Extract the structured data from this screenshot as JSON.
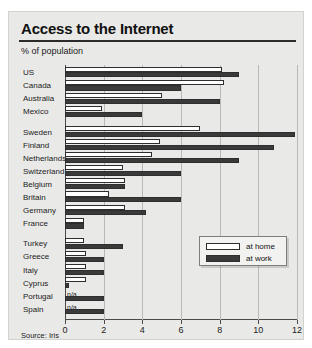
{
  "title": "Access to the Internet",
  "subtitle": "% of population",
  "source": "Source: Iris",
  "legend": {
    "home_label": "at home",
    "work_label": "at work"
  },
  "na_label": "n/a",
  "colors": {
    "home": "#ffffff",
    "work": "#3a3a3a",
    "panel": "#e9e9e7",
    "axis": "#4a4a4a",
    "grid": "#b9b9b5"
  },
  "chart_data": {
    "type": "bar",
    "orientation": "horizontal",
    "title": "Access to the Internet",
    "subtitle": "% of population",
    "xlabel": "% of population",
    "ylabel": "",
    "xlim": [
      0,
      12
    ],
    "xticks": [
      0,
      2,
      4,
      6,
      8,
      10,
      12
    ],
    "xticklabels": [
      "0",
      "2",
      "4",
      "6",
      "8",
      "10",
      "12"
    ],
    "grid": true,
    "legend_position": "bottom-right",
    "legend_entries": [
      "at home",
      "at work"
    ],
    "source": "Source: Iris",
    "categories": [
      "US",
      "Canada",
      "Australia",
      "Mexico",
      "Sweden",
      "Finland",
      "Netherlands",
      "Switzerland",
      "Belgium",
      "Britain",
      "Germany",
      "France",
      "Turkey",
      "Greece",
      "Italy",
      "Cyprus",
      "Portugal",
      "Spain"
    ],
    "group_breaks": [
      4,
      12
    ],
    "series": [
      {
        "name": "at home",
        "values": [
          8.1,
          8.2,
          5.0,
          1.9,
          7.0,
          4.9,
          4.5,
          3.0,
          3.1,
          2.3,
          3.1,
          1.0,
          1.0,
          1.1,
          1.1,
          1.1,
          null,
          null
        ]
      },
      {
        "name": "at work",
        "values": [
          9.0,
          6.0,
          8.0,
          4.0,
          11.9,
          10.8,
          9.0,
          6.0,
          3.1,
          6.0,
          4.2,
          1.0,
          3.0,
          2.0,
          2.0,
          0.2,
          2.0,
          2.0
        ]
      }
    ],
    "na_rows": [
      "Portugal",
      "Spain"
    ],
    "na_series": "at home"
  }
}
